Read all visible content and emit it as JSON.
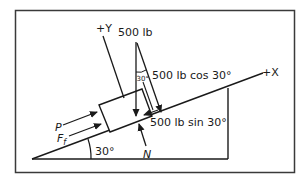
{
  "diagram": {
    "type": "free-body-diagram",
    "labels": {
      "y_axis": "+Y",
      "x_axis": "+X",
      "weight": "500 lb",
      "normal_component": "500 lb cos 30°",
      "parallel_component": "500 lb sin 30°",
      "angle_between_weight_and_normal": "30°",
      "incline_angle": "30°",
      "applied_force": "P",
      "friction_force_main": "F",
      "friction_force_sub": "f",
      "normal_force": "N"
    },
    "colors": {
      "line": "#1a1a1a",
      "frame": "#3a3a3a",
      "background": "#ffffff"
    }
  }
}
